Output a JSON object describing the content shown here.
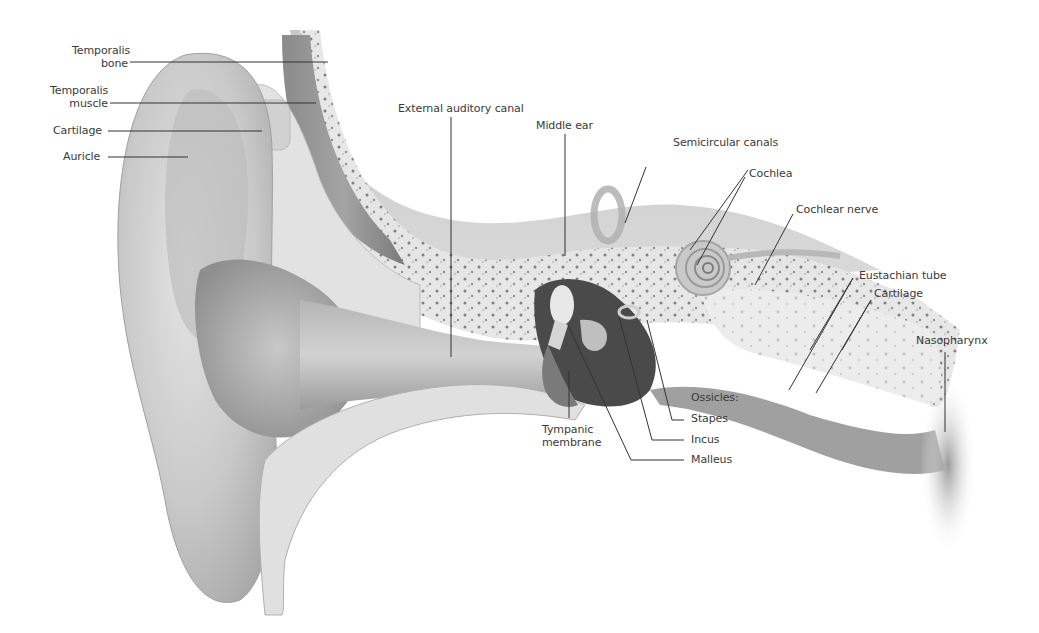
{
  "diagram": {
    "background": "#ffffff",
    "line_color": "#333333",
    "text_color": "#3a3a3a",
    "labels": {
      "temporalis_bone": {
        "line1": "Temporalis",
        "line2": "bone"
      },
      "temporalis_muscle": {
        "line1": "Temporalis",
        "line2": "muscle"
      },
      "cartilage_left": "Cartilage",
      "auricle": "Auricle",
      "external_auditory_canal": "External auditory canal",
      "middle_ear": "Middle ear",
      "semicircular_canals": "Semicircular canals",
      "cochlea": "Cochlea",
      "cochlear_nerve": "Cochlear nerve",
      "eustachian_tube": "Eustachian tube",
      "cartilage_right": "Cartilage",
      "nasopharynx": "Nasopharynx",
      "ossicles": "Ossicles:",
      "stapes": "Stapes",
      "incus": "Incus",
      "malleus": "Malleus",
      "tympanic_membrane": {
        "line1": "Tympanic",
        "line2": "membrane"
      }
    }
  }
}
